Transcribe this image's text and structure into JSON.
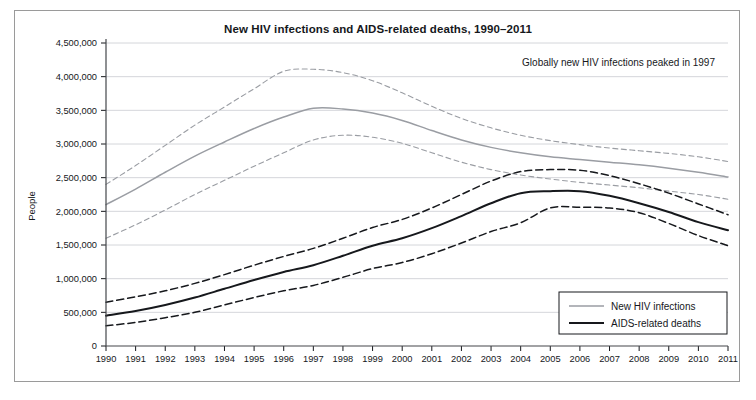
{
  "figure": {
    "title": "New HIV infections and AIDS-related deaths, 1990–2011",
    "annotation": "Globally new HIV infections peaked in 1997",
    "background_color": "#ffffff",
    "frame_color": "#9a9a9a"
  },
  "legend": {
    "position": "bottom-right",
    "entries": [
      {
        "label": "New HIV infections",
        "color": "#9a9da3",
        "style": "solid"
      },
      {
        "label": "AIDS-related deaths",
        "color": "#16181c",
        "style": "solid"
      }
    ]
  },
  "chart_data": {
    "type": "line",
    "title": "New HIV infections and AIDS-related deaths, 1990–2011",
    "xlabel": "",
    "ylabel": "People",
    "xlim": [
      1990,
      2011
    ],
    "ylim": [
      0,
      4500000
    ],
    "grid": true,
    "ytick_labels": [
      "0",
      "500,000",
      "1,000,000",
      "1,500,000",
      "2,000,000",
      "2,500,000",
      "3,000,000",
      "3,500,000",
      "4,000,000",
      "4,500,000"
    ],
    "ytick_values": [
      0,
      500000,
      1000000,
      1500000,
      2000000,
      2500000,
      3000000,
      3500000,
      4000000,
      4500000
    ],
    "categories": [
      1990,
      1991,
      1992,
      1993,
      1994,
      1995,
      1996,
      1997,
      1998,
      1999,
      2000,
      2001,
      2002,
      2003,
      2004,
      2005,
      2006,
      2007,
      2008,
      2009,
      2010,
      2011
    ],
    "xtick_labels": [
      "1990",
      "1991",
      "1992",
      "1993",
      "1994",
      "1995",
      "1996",
      "1997",
      "1998",
      "1999",
      "2000",
      "2001",
      "2002",
      "2003",
      "2004",
      "2005",
      "2006",
      "2007",
      "2008",
      "2009",
      "2010",
      "2011"
    ],
    "series": [
      {
        "name": "New HIV infections",
        "color": "#9a9da3",
        "style": "solid",
        "values": [
          2100000,
          2330000,
          2580000,
          2820000,
          3030000,
          3230000,
          3400000,
          3530000,
          3520000,
          3460000,
          3350000,
          3200000,
          3060000,
          2950000,
          2870000,
          2810000,
          2770000,
          2730000,
          2690000,
          2640000,
          2580000,
          2510000
        ]
      },
      {
        "name": "New HIV infections upper bound",
        "color": "#9a9da3",
        "style": "dashed",
        "values": [
          2400000,
          2680000,
          2980000,
          3280000,
          3550000,
          3820000,
          4080000,
          4110000,
          4060000,
          3940000,
          3760000,
          3560000,
          3380000,
          3240000,
          3130000,
          3050000,
          2990000,
          2940000,
          2900000,
          2860000,
          2810000,
          2740000
        ]
      },
      {
        "name": "New HIV infections lower bound",
        "color": "#9a9da3",
        "style": "dashed",
        "values": [
          1600000,
          1800000,
          2020000,
          2250000,
          2460000,
          2670000,
          2870000,
          3060000,
          3130000,
          3100000,
          3010000,
          2870000,
          2730000,
          2620000,
          2540000,
          2480000,
          2430000,
          2390000,
          2350000,
          2300000,
          2250000,
          2180000
        ]
      },
      {
        "name": "AIDS-related deaths",
        "color": "#16181c",
        "style": "solid",
        "values": [
          450000,
          520000,
          610000,
          720000,
          850000,
          980000,
          1100000,
          1200000,
          1340000,
          1490000,
          1600000,
          1750000,
          1930000,
          2120000,
          2270000,
          2300000,
          2300000,
          2230000,
          2120000,
          1990000,
          1840000,
          1720000
        ]
      },
      {
        "name": "AIDS-related deaths upper bound",
        "color": "#16181c",
        "style": "dashed",
        "values": [
          650000,
          730000,
          820000,
          930000,
          1060000,
          1200000,
          1330000,
          1450000,
          1600000,
          1760000,
          1880000,
          2050000,
          2250000,
          2450000,
          2590000,
          2620000,
          2610000,
          2530000,
          2410000,
          2270000,
          2110000,
          1950000
        ]
      },
      {
        "name": "AIDS-related deaths lower bound",
        "color": "#16181c",
        "style": "dashed",
        "values": [
          300000,
          350000,
          420000,
          500000,
          610000,
          720000,
          820000,
          900000,
          1020000,
          1150000,
          1240000,
          1370000,
          1530000,
          1700000,
          1830000,
          2050000,
          2060000,
          2050000,
          1980000,
          1820000,
          1640000,
          1490000
        ]
      }
    ]
  }
}
